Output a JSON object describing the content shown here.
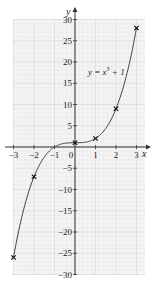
{
  "chart_data": {
    "type": "line",
    "title": "",
    "xlabel": "x",
    "ylabel": "y",
    "xlim": [
      -3,
      3
    ],
    "ylim": [
      -30,
      30
    ],
    "grid": true,
    "annotation": "y = x³ + 1",
    "x_ticks": [
      "-3",
      "-2",
      "-1",
      "0",
      "1",
      "2",
      "3"
    ],
    "y_ticks": [
      "30",
      "25",
      "20",
      "15",
      "10",
      "5",
      "-5",
      "-10",
      "-15",
      "-20",
      "-25",
      "-30"
    ],
    "series": [
      {
        "name": "y = x^3 + 1",
        "x": [
          -3,
          -2,
          -1,
          0,
          1,
          2,
          3
        ],
        "y": [
          -26,
          -7,
          0,
          1,
          2,
          9,
          28
        ],
        "markers": "x"
      }
    ],
    "plotted_points": [
      {
        "x": -3,
        "y": -26
      },
      {
        "x": -2,
        "y": -7
      },
      {
        "x": 0,
        "y": 1
      },
      {
        "x": 1,
        "y": 2
      },
      {
        "x": 2,
        "y": 9
      },
      {
        "x": 3,
        "y": 28
      }
    ],
    "colors": {
      "grid_minor": "#e6e6e6",
      "grid_major": "#cfcfcf",
      "axis": "#333333",
      "curve": "#444444",
      "background": "#f4f4f4"
    }
  },
  "labels": {
    "x_axis": "x",
    "y_axis": "y",
    "function": "y = x³ + 1",
    "function_base": "y = x",
    "function_exp": "3",
    "function_tail": " + 1"
  }
}
